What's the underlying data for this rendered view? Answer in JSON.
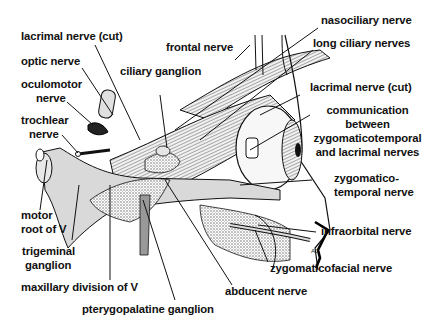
{
  "figure": {
    "colors": {
      "ink": "#111111",
      "nerve_fill": "#d9d9d9",
      "bone_stipple": "#bdbdbd",
      "background": "#ffffff"
    },
    "labels": {
      "lacrimal_nerve_cut_left": "lacrimal nerve (cut)",
      "optic_nerve": "optic nerve",
      "oculomotor_nerve_1": "oculomotor",
      "oculomotor_nerve_2": "nerve",
      "trochlear_nerve_1": "trochlear",
      "trochlear_nerve_2": "nerve",
      "motor_root_1": "motor",
      "motor_root_2": "root of V",
      "trigeminal_ganglion_1": "trigeminal",
      "trigeminal_ganglion_2": "ganglion",
      "maxillary_division": "maxillary division of V",
      "pterygopalatine_ganglion": "pterygopalatine ganglion",
      "abducent_nerve": "abducent nerve",
      "zygomaticofacial_nerve": "zygomaticofacial nerve",
      "infraorbital_nerve": "infraorbital nerve",
      "zygomaticotemporal_nerve_1": "zygomatico-",
      "zygomaticotemporal_nerve_2": "temporal nerve",
      "communication_1": "communication",
      "communication_2": "between",
      "communication_3": "zygomaticotemporal",
      "communication_4": "and lacrimal nerves",
      "lacrimal_nerve_cut_right": "lacrimal nerve (cut)",
      "long_ciliary_nerves": "long ciliary nerves",
      "nasociliary_nerve": "nasociliary nerve",
      "frontal_nerve": "frontal nerve",
      "ciliary_ganglion": "ciliary ganglion"
    },
    "signature": "AJ"
  }
}
